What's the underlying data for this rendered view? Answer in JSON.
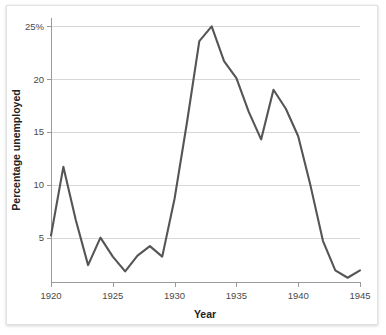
{
  "chart_data": {
    "type": "line",
    "title": "",
    "xlabel": "Year",
    "ylabel": "Percentage unemployed",
    "xlim": [
      1920,
      1945
    ],
    "ylim": [
      0.8,
      25.6
    ],
    "grid": true,
    "legend": "none",
    "x_ticks": [
      1920,
      1925,
      1930,
      1935,
      1940,
      1945
    ],
    "x_tick_labels": [
      "1920",
      "1925",
      "1930",
      "1935",
      "1940",
      "1945"
    ],
    "y_ticks": [
      5,
      10,
      15,
      20,
      25
    ],
    "y_tick_labels": [
      "5",
      "10",
      "15",
      "20",
      "25%"
    ],
    "line_color": "#555555",
    "grid_color": "#d8d8d8",
    "axis_color": "#9a9a9a",
    "x": [
      1920,
      1921,
      1922,
      1923,
      1924,
      1925,
      1926,
      1927,
      1928,
      1929,
      1930,
      1931,
      1932,
      1933,
      1934,
      1935,
      1936,
      1937,
      1938,
      1939,
      1940,
      1941,
      1942,
      1943,
      1944,
      1945
    ],
    "values": [
      5.2,
      11.7,
      6.7,
      2.4,
      5.0,
      3.2,
      1.8,
      3.3,
      4.2,
      3.2,
      8.7,
      15.9,
      23.6,
      25.0,
      21.7,
      20.1,
      16.9,
      14.3,
      19.0,
      17.2,
      14.6,
      9.9,
      4.7,
      1.9,
      1.2,
      1.9
    ]
  },
  "axes": {
    "y_title": "Percentage unemployed",
    "x_title": "Year"
  }
}
